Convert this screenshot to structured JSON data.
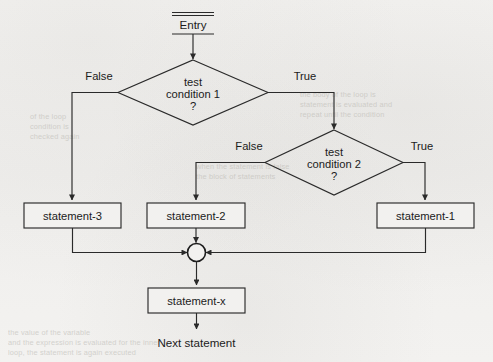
{
  "diagram": {
    "type": "flowchart",
    "entry": {
      "label": "Entry"
    },
    "exit": {
      "label": "Next statement"
    },
    "decisions": [
      {
        "id": "test-condition-1",
        "line1": "test",
        "line2": "condition 1",
        "line3": "?",
        "false_label": "False",
        "true_label": "True"
      },
      {
        "id": "test-condition-2",
        "line1": "test",
        "line2": "condition 2",
        "line3": "?",
        "false_label": "False",
        "true_label": "True"
      }
    ],
    "processes": [
      {
        "id": "statement-3",
        "label": "statement-3"
      },
      {
        "id": "statement-2",
        "label": "statement-2"
      },
      {
        "id": "statement-1",
        "label": "statement-1"
      },
      {
        "id": "statement-x",
        "label": "statement-x"
      }
    ],
    "connector": {
      "id": "merge-connector",
      "label": ""
    },
    "colors": {
      "paper": "#f2f1ef",
      "ink": "#2a2a2a",
      "text": "#1b1b1b",
      "ghost": "#b9b7b1"
    }
  },
  "ghost_text": {
    "lines": [
      {
        "text": "the body of the loop is",
        "x": 300,
        "y": 96
      },
      {
        "text": "statement is evaluated and",
        "x": 300,
        "y": 106
      },
      {
        "text": "repeat until the condition",
        "x": 300,
        "y": 116
      },
      {
        "text": "when the statement is false",
        "x": 196,
        "y": 168
      },
      {
        "text": "the block of statements",
        "x": 196,
        "y": 178
      },
      {
        "text": "of the loop",
        "x": 30,
        "y": 118
      },
      {
        "text": "condition is",
        "x": 30,
        "y": 128
      },
      {
        "text": "checked again",
        "x": 30,
        "y": 138
      },
      {
        "text": "the value of the variable",
        "x": 8,
        "y": 334
      },
      {
        "text": "and the expression is evaluated for the inner",
        "x": 8,
        "y": 344
      },
      {
        "text": "loop, the statement is again executed",
        "x": 8,
        "y": 354
      }
    ]
  }
}
